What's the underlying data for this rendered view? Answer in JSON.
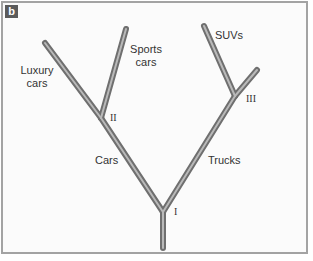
{
  "panel": {
    "label": "b"
  },
  "labels": {
    "luxury": "Luxury cars",
    "luxury_line1": "Luxury",
    "luxury_line2": "cars",
    "sports_line1": "Sports",
    "sports_line2": "cars",
    "suvs": "SUVs",
    "cars": "Cars",
    "trucks": "Trucks"
  },
  "nodes": {
    "n1": "I",
    "n2": "II",
    "n3": "III"
  },
  "credit": "© Cengage Learning",
  "colors": {
    "branch_outer": "#6f6f6f",
    "branch_inner": "#b9b9b9",
    "border": "#a3a3a3",
    "label_bg": "#5b5b5b"
  },
  "tree": {
    "branches": [
      {
        "name": "trunk",
        "from": [
          163,
          212
        ],
        "to": [
          163,
          248
        ]
      },
      {
        "name": "cars",
        "from": [
          163,
          212
        ],
        "to": [
          101,
          118
        ]
      },
      {
        "name": "trucks",
        "from": [
          163,
          212
        ],
        "to": [
          235,
          96
        ]
      },
      {
        "name": "luxury-cars",
        "from": [
          101,
          118
        ],
        "to": [
          45,
          43
        ]
      },
      {
        "name": "sports-cars",
        "from": [
          101,
          118
        ],
        "to": [
          126,
          29
        ]
      },
      {
        "name": "suvs",
        "from": [
          235,
          96
        ],
        "to": [
          204,
          26
        ]
      },
      {
        "name": "other-trucks",
        "from": [
          235,
          96
        ],
        "to": [
          257,
          70
        ]
      }
    ]
  }
}
